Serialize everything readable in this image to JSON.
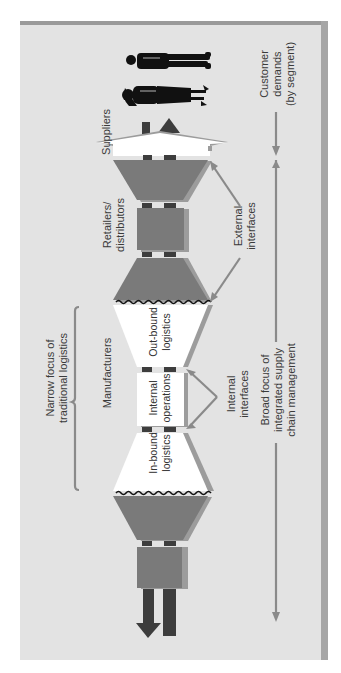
{
  "diagram": {
    "orientation": "rotated 90 degrees counter-clockwise",
    "colors": {
      "panel_background": "#e3e3e3",
      "panel_border": "#9a9a9a",
      "stage_fill": "#7a7a7a",
      "stage_shadow": "#9c9c9c",
      "connector": "#3d3d3d",
      "logistics_fill": "#ffffff",
      "arrow_line": "#8a8a8a",
      "people": "#111111"
    },
    "stages": {
      "suppliers": "Suppliers",
      "manufacturers": "Manufacturers",
      "retailers": "Retailers/\ndistributors",
      "customers": "Customer\ndemands\n(by segment)"
    },
    "logistics": {
      "inbound": "In-bound\nlogistics",
      "internal": "Internal\noperations",
      "outbound": "Out-bound\nlogistics"
    },
    "annotations": {
      "narrow_focus": "Narrow focus of\ntraditional logistics",
      "internal_interfaces": "Internal\ninterfaces",
      "external_interfaces": "External\ninterfaces",
      "broad_focus": "Broad focus of\nintegrated supply\nchain management"
    },
    "icons": [
      "customer-man-icon",
      "customer-woman-icon",
      "outflow-arrow-icon",
      "inflow-arrow-icon"
    ]
  }
}
